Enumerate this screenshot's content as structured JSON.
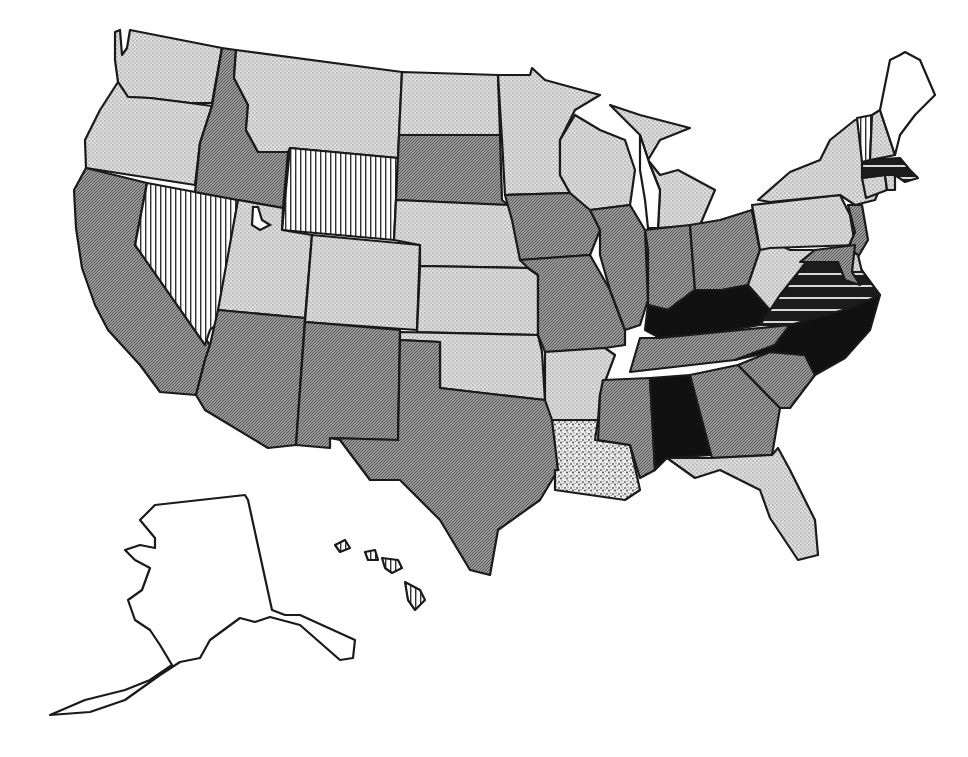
{
  "map": {
    "type": "choropleth",
    "region": "United States",
    "title": "",
    "legend_visible": false,
    "categories": [
      {
        "id": "light",
        "pattern": "light-dot",
        "fill": "#d4d4d4"
      },
      {
        "id": "medium",
        "pattern": "dark-hatch",
        "fill": "#8f8f8f"
      },
      {
        "id": "vstripe",
        "pattern": "vertical-stripes",
        "fill": "#ffffff"
      },
      {
        "id": "black",
        "pattern": "solid",
        "fill": "#111111"
      },
      {
        "id": "hstripe",
        "pattern": "horizontal-stripes",
        "fill": "#1a1a1a"
      },
      {
        "id": "speckle",
        "pattern": "speckled",
        "fill": "#e2e2e2"
      },
      {
        "id": "blank",
        "pattern": "none",
        "fill": "#ffffff"
      }
    ],
    "states": {
      "WA": "light",
      "OR": "light",
      "CA": "medium",
      "NV": "vstripe",
      "ID": "medium",
      "MT": "light",
      "WY": "vstripe",
      "UT": "light",
      "CO": "light",
      "AZ": "medium",
      "NM": "medium",
      "ND": "light",
      "SD": "medium",
      "NE": "light",
      "KS": "light",
      "OK": "light",
      "TX": "medium",
      "MN": "light",
      "IA": "medium",
      "MO": "medium",
      "AR": "light",
      "LA": "speckle",
      "WI": "light",
      "IL": "medium",
      "MI": "light",
      "IN": "medium",
      "OH": "medium",
      "KY": "black",
      "TN": "medium",
      "MS": "medium",
      "AL": "black",
      "GA": "medium",
      "FL": "light",
      "SC": "medium",
      "NC": "black",
      "VA": "hstripe",
      "WV": "light",
      "PA": "light",
      "NY": "light",
      "NJ": "medium",
      "DE": "light",
      "MD": "medium",
      "CT": "light",
      "RI": "light",
      "MA": "hstripe",
      "VT": "vstripe",
      "NH": "light",
      "ME": "blank",
      "AK": "blank",
      "HI": "vstripe"
    }
  },
  "chart_data": {
    "type": "choropleth",
    "title": "",
    "region": "USA",
    "legend": [],
    "classes": {
      "light-dot": [
        "WA",
        "OR",
        "MT",
        "UT",
        "CO",
        "ND",
        "NE",
        "KS",
        "OK",
        "MN",
        "AR",
        "WI",
        "MI",
        "FL",
        "WV",
        "PA",
        "NY",
        "DE",
        "CT",
        "RI",
        "NH"
      ],
      "dark-hatch": [
        "CA",
        "ID",
        "AZ",
        "NM",
        "SD",
        "TX",
        "IA",
        "MO",
        "IL",
        "IN",
        "OH",
        "TN",
        "MS",
        "GA",
        "SC",
        "NJ",
        "MD"
      ],
      "vertical-stripes": [
        "NV",
        "WY",
        "VT",
        "HI"
      ],
      "solid-black": [
        "KY",
        "NC",
        "AL"
      ],
      "horizontal-stripes": [
        "VA",
        "MA"
      ],
      "speckled": [
        "LA"
      ],
      "blank": [
        "ME",
        "AK"
      ]
    }
  }
}
